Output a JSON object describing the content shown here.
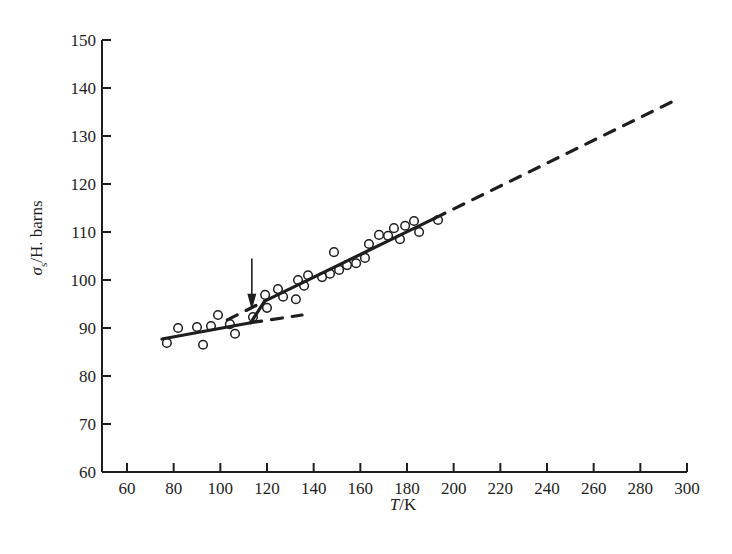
{
  "chart_data": {
    "type": "scatter",
    "title": "",
    "xlabel": "T/K",
    "ylabel": "σs/H. barns",
    "xlim": [
      50,
      300
    ],
    "ylim": [
      60,
      150
    ],
    "grid": false,
    "legend": null,
    "x_ticks": [
      60,
      80,
      100,
      120,
      140,
      160,
      180,
      200,
      220,
      240,
      260,
      280,
      300
    ],
    "y_ticks": [
      60,
      70,
      80,
      90,
      100,
      110,
      120,
      130,
      140,
      150
    ],
    "series": [
      {
        "name": "measured",
        "marker": "open-circle",
        "points": [
          [
            77.1,
            86.9
          ],
          [
            81.9,
            90.0
          ],
          [
            90.0,
            90.2
          ],
          [
            92.6,
            86.5
          ],
          [
            96.0,
            90.4
          ],
          [
            99.0,
            92.7
          ],
          [
            104.1,
            90.8
          ],
          [
            106.3,
            88.8
          ],
          [
            114.0,
            92.3
          ],
          [
            119.2,
            96.9
          ],
          [
            120.0,
            94.2
          ],
          [
            124.7,
            98.1
          ],
          [
            126.9,
            96.5
          ],
          [
            132.4,
            96.0
          ],
          [
            133.3,
            100.0
          ],
          [
            135.9,
            98.8
          ],
          [
            137.6,
            101.0
          ],
          [
            143.6,
            100.6
          ],
          [
            147.0,
            101.3
          ],
          [
            148.7,
            105.8
          ],
          [
            150.9,
            102.1
          ],
          [
            154.3,
            103.1
          ],
          [
            158.2,
            103.5
          ],
          [
            162.0,
            104.6
          ],
          [
            163.7,
            107.5
          ],
          [
            168.0,
            109.4
          ],
          [
            171.9,
            109.2
          ],
          [
            174.4,
            110.8
          ],
          [
            177.0,
            108.5
          ],
          [
            179.2,
            111.3
          ],
          [
            183.0,
            112.3
          ],
          [
            185.2,
            110.0
          ],
          [
            193.3,
            112.5
          ]
        ]
      },
      {
        "name": "low-T fit",
        "style": "solid",
        "points": [
          [
            75.0,
            87.7
          ],
          [
            113.0,
            91.1
          ]
        ]
      },
      {
        "name": "low-T fit extrapolation",
        "style": "dashed",
        "points": [
          [
            113.0,
            91.1
          ],
          [
            135.0,
            92.7
          ]
        ]
      },
      {
        "name": "transition",
        "style": "solid",
        "points": [
          [
            113.0,
            91.1
          ],
          [
            119.0,
            95.6
          ]
        ]
      },
      {
        "name": "high-T fit",
        "style": "solid",
        "points": [
          [
            119.0,
            95.6
          ],
          [
            192.0,
            112.9
          ]
        ]
      },
      {
        "name": "high-T fit back-extrapolation",
        "style": "dashed",
        "points": [
          [
            103.0,
            91.7
          ],
          [
            117.0,
            95.1
          ]
        ]
      },
      {
        "name": "high-T fit extrapolation",
        "style": "dashed",
        "points": [
          [
            192.0,
            112.9
          ],
          [
            296.0,
            137.7
          ]
        ]
      }
    ],
    "annotations": [
      {
        "type": "arrow",
        "direction": "down",
        "x": 113.5,
        "y_from": 104.5,
        "y_to": 93.8,
        "label": ""
      }
    ]
  },
  "axes": {
    "x_label_italic": "T",
    "x_label_unit": "/K",
    "y_label_symbol": "σ",
    "y_label_subscript": "s",
    "y_label_unit": "/H. barns"
  },
  "colors": {
    "ink": "#1e1e1e",
    "background": "#ffffff"
  }
}
